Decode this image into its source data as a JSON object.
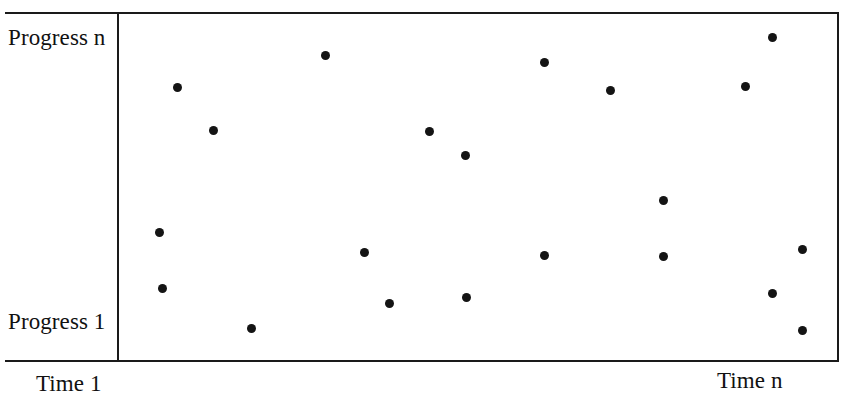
{
  "figure": {
    "background_color": "#ffffff",
    "frame_color": "#1a1a1a",
    "point_color": "#141414"
  },
  "labels": {
    "y_top": "Progress n",
    "y_bottom": "Progress 1",
    "x_left": "Time 1",
    "x_right": "Time n"
  },
  "chart_data": {
    "type": "scatter",
    "title": "",
    "xlabel": "Time",
    "ylabel": "Progress",
    "xlim": [
      0,
      100
    ],
    "ylim": [
      0,
      100
    ],
    "grid": false,
    "legend": null,
    "x_tick_labels": [
      "Time 1",
      "Time n"
    ],
    "y_tick_labels": [
      "Progress 1",
      "Progress n"
    ],
    "marker": "filled-circle",
    "marker_size_px": 9,
    "n_points": 21,
    "series": [
      {
        "name": "progress over time",
        "points": [
          {
            "x": 8.2,
            "y": 78.8
          },
          {
            "x": 13.2,
            "y": 66.3
          },
          {
            "x": 5.7,
            "y": 36.9
          },
          {
            "x": 6.0,
            "y": 20.8
          },
          {
            "x": 18.4,
            "y": 9.0
          },
          {
            "x": 28.7,
            "y": 88.1
          },
          {
            "x": 34.2,
            "y": 31.1
          },
          {
            "x": 37.7,
            "y": 16.4
          },
          {
            "x": 43.2,
            "y": 66.1
          },
          {
            "x": 48.3,
            "y": 59.1
          },
          {
            "x": 48.4,
            "y": 18.1
          },
          {
            "x": 59.2,
            "y": 86.0
          },
          {
            "x": 59.2,
            "y": 30.2
          },
          {
            "x": 68.4,
            "y": 78.0
          },
          {
            "x": 75.9,
            "y": 46.0
          },
          {
            "x": 75.9,
            "y": 29.9
          },
          {
            "x": 87.3,
            "y": 79.1
          },
          {
            "x": 91.0,
            "y": 93.1
          },
          {
            "x": 91.0,
            "y": 19.2
          },
          {
            "x": 95.2,
            "y": 32.0
          },
          {
            "x": 95.2,
            "y": 8.6
          }
        ]
      }
    ]
  }
}
